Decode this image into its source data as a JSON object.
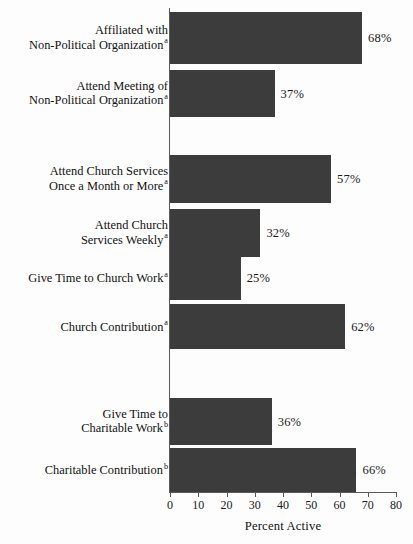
{
  "chart_data": {
    "type": "bar",
    "orientation": "horizontal",
    "title": "",
    "xlabel": "Percent Active",
    "ylabel": "",
    "xlim": [
      0,
      80
    ],
    "xticks": [
      0,
      10,
      20,
      30,
      40,
      50,
      60,
      70,
      80
    ],
    "xtick_labels": [
      "0",
      "10",
      "20",
      "30",
      "40",
      "50",
      "60",
      "70",
      "80"
    ],
    "grid": false,
    "legend": null,
    "bar_color": "#3c3c3c",
    "background_color": "#fdfdfd",
    "axis_color": "#5a5a5a",
    "categories": [
      "Affiliated with Non-Political Organization a",
      "Attend Meeting of Non-Political Organization a",
      "Attend Church Services Once a Month or More a",
      "Attend Church Services Weekly a",
      "Give Time to Church Work a",
      "Church Contribution a",
      "Give Time to Charitable Work b",
      "Charitable Contribution b"
    ],
    "values": [
      68,
      37,
      57,
      32,
      25,
      62,
      36,
      66
    ],
    "value_labels": [
      "68%",
      "37%",
      "57%",
      "32%",
      "25%",
      "62%",
      "36%",
      "66%"
    ],
    "groups": [
      {
        "name": "non-political-organization",
        "bar_indices": [
          0,
          1
        ]
      },
      {
        "name": "church",
        "bar_indices": [
          2,
          3,
          4,
          5
        ]
      },
      {
        "name": "charitable",
        "bar_indices": [
          6,
          7
        ]
      }
    ],
    "bars": [
      {
        "label_lines": [
          "Affiliated with",
          "Non-Political Organization"
        ],
        "superscript": "a",
        "value": 68,
        "value_label": "68%",
        "top": 12,
        "height": 52
      },
      {
        "label_lines": [
          "Attend Meeting of",
          "Non-Political Organization"
        ],
        "superscript": "a",
        "value": 37,
        "value_label": "37%",
        "top": 70,
        "height": 47
      },
      {
        "label_lines": [
          "Attend Church Services",
          "Once a Month or More"
        ],
        "superscript": "a",
        "value": 57,
        "value_label": "57%",
        "top": 155,
        "height": 48
      },
      {
        "label_lines": [
          "Attend Church",
          "Services Weekly"
        ],
        "superscript": "a",
        "value": 32,
        "value_label": "32%",
        "top": 209,
        "height": 48
      },
      {
        "label_lines": [
          "Give Time to Church Work"
        ],
        "superscript": "a",
        "value": 25,
        "value_label": "25%",
        "top": 256,
        "height": 44
      },
      {
        "label_lines": [
          "Church Contribution"
        ],
        "superscript": "a",
        "value": 62,
        "value_label": "62%",
        "top": 304,
        "height": 45
      },
      {
        "label_lines": [
          "Give Time to",
          "Charitable Work"
        ],
        "superscript": "b",
        "value": 36,
        "value_label": "36%",
        "top": 398,
        "height": 47
      },
      {
        "label_lines": [
          "Charitable Contribution"
        ],
        "superscript": "b",
        "value": 66,
        "value_label": "66%",
        "top": 448,
        "height": 44
      }
    ]
  }
}
